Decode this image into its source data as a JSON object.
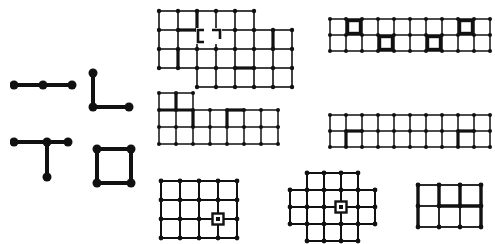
{
  "figure": {
    "background_color": "#ffffff",
    "ink_color": "#111111",
    "canvas": {
      "width": 495,
      "height": 242
    }
  },
  "panels": [
    {
      "id": "panel-path-3",
      "name": "path-graph",
      "type": "node-edge-graph",
      "position": {
        "x": 10,
        "y": 76
      },
      "size": {
        "width": 66,
        "height": 18
      },
      "node_radius": 4.5,
      "edge_width": 4,
      "nodes": [
        [
          4,
          9
        ],
        [
          33,
          9
        ],
        [
          62,
          9
        ]
      ],
      "edges": [
        [
          0,
          1
        ],
        [
          1,
          2
        ]
      ],
      "node_count": 3,
      "edge_count": 2
    },
    {
      "id": "panel-ell",
      "name": "ell-graph",
      "type": "node-edge-graph",
      "position": {
        "x": 88,
        "y": 68
      },
      "size": {
        "width": 46,
        "height": 46
      },
      "node_radius": 4.5,
      "edge_width": 4,
      "nodes": [
        [
          5,
          5
        ],
        [
          5,
          39
        ],
        [
          41,
          39
        ]
      ],
      "edges": [
        [
          0,
          1
        ],
        [
          1,
          2
        ]
      ],
      "node_count": 3,
      "edge_count": 2
    },
    {
      "id": "panel-tee",
      "name": "tee-graph",
      "type": "node-edge-graph",
      "position": {
        "x": 10,
        "y": 136
      },
      "size": {
        "width": 62,
        "height": 46
      },
      "node_radius": 4.5,
      "edge_width": 4,
      "nodes": [
        [
          4,
          6
        ],
        [
          37,
          6
        ],
        [
          58,
          6
        ],
        [
          37,
          41
        ]
      ],
      "edges": [
        [
          0,
          1
        ],
        [
          1,
          2
        ],
        [
          1,
          3
        ]
      ],
      "node_count": 4,
      "edge_count": 3
    },
    {
      "id": "panel-square",
      "name": "square-cycle-graph",
      "type": "node-edge-graph",
      "position": {
        "x": 92,
        "y": 144
      },
      "size": {
        "width": 44,
        "height": 44
      },
      "node_radius": 4.5,
      "edge_width": 4,
      "nodes": [
        [
          5,
          5
        ],
        [
          39,
          5
        ],
        [
          39,
          39
        ],
        [
          5,
          39
        ]
      ],
      "edges": [
        [
          0,
          1
        ],
        [
          1,
          2
        ],
        [
          2,
          3
        ],
        [
          3,
          0
        ]
      ],
      "node_count": 4,
      "edge_count": 4
    },
    {
      "id": "panel-top-middle",
      "name": "stepped-lattice-top",
      "type": "grid-lattice",
      "position": {
        "x": 156,
        "y": 8
      },
      "cell": 19,
      "cols": 7,
      "rows": 4,
      "line_width": 1.6,
      "bold_width": 3.2,
      "dot_radius": 2.2,
      "cells": [
        [
          0,
          0
        ],
        [
          1,
          0
        ],
        [
          2,
          0
        ],
        [
          3,
          0
        ],
        [
          4,
          0
        ],
        [
          0,
          1
        ],
        [
          1,
          1
        ],
        [
          2,
          1
        ],
        [
          3,
          1
        ],
        [
          4,
          1
        ],
        [
          5,
          1
        ],
        [
          6,
          1
        ],
        [
          0,
          2
        ],
        [
          1,
          2
        ],
        [
          2,
          2
        ],
        [
          3,
          2
        ],
        [
          4,
          2
        ],
        [
          5,
          2
        ],
        [
          6,
          2
        ],
        [
          2,
          3
        ],
        [
          3,
          3
        ],
        [
          4,
          3
        ],
        [
          5,
          3
        ],
        [
          6,
          3
        ]
      ],
      "bold_edges": [
        {
          "type": "h",
          "x": 1,
          "y": 1,
          "len": 1
        },
        {
          "type": "v",
          "x": 2,
          "y": 0,
          "len": 1
        },
        {
          "type": "v",
          "x": 1,
          "y": 2,
          "len": 1
        },
        {
          "type": "v",
          "x": 6,
          "y": 1,
          "len": 1
        },
        {
          "type": "h",
          "x": 4,
          "y": 3,
          "len": 1
        }
      ],
      "marker": {
        "shape": "bracket-pair",
        "x": 196,
        "y": 28,
        "width": 22,
        "height": 12
      }
    },
    {
      "id": "panel-top-right",
      "name": "strip-lattice-top-right",
      "type": "grid-lattice",
      "position": {
        "x": 327,
        "y": 16
      },
      "cell": 16,
      "cols": 10,
      "rows": 2,
      "line_width": 1.5,
      "bold_width": 3.2,
      "dot_radius": 2.0,
      "highlight_cells": [
        [
          1,
          0
        ],
        [
          3,
          1
        ],
        [
          6,
          1
        ],
        [
          8,
          0
        ]
      ],
      "highlight_style": "bold-rectangle-outline"
    },
    {
      "id": "panel-mid-left",
      "name": "ell-lattice-middle",
      "type": "grid-lattice",
      "position": {
        "x": 156,
        "y": 90
      },
      "cell": 17,
      "cols": 7,
      "rows": 3,
      "line_width": 1.5,
      "bold_width": 3.2,
      "dot_radius": 2.0,
      "cells": [
        [
          0,
          0
        ],
        [
          1,
          0
        ],
        [
          0,
          1
        ],
        [
          1,
          2
        ],
        [
          0,
          1
        ],
        [
          1,
          1
        ],
        [
          2,
          1
        ],
        [
          3,
          1
        ],
        [
          4,
          1
        ],
        [
          5,
          1
        ],
        [
          6,
          1
        ],
        [
          0,
          2
        ],
        [
          1,
          2
        ],
        [
          2,
          2
        ],
        [
          3,
          2
        ],
        [
          4,
          2
        ],
        [
          5,
          2
        ],
        [
          6,
          2
        ]
      ],
      "bold_edges": [
        {
          "type": "v",
          "x": 1,
          "y": 0,
          "len": 1
        },
        {
          "type": "h",
          "x": 0,
          "y": 1,
          "len": 2
        },
        {
          "type": "v",
          "x": 2,
          "y": 1,
          "len": 1
        },
        {
          "type": "h",
          "x": 4,
          "y": 1,
          "len": 1
        },
        {
          "type": "v",
          "x": 4,
          "y": 1,
          "len": 1
        }
      ]
    },
    {
      "id": "panel-mid-right",
      "name": "strip-lattice-middle-right",
      "type": "grid-lattice",
      "position": {
        "x": 327,
        "y": 112
      },
      "cell": 16,
      "cols": 10,
      "rows": 2,
      "line_width": 1.5,
      "bold_width": 3.2,
      "dot_radius": 2.0,
      "bold_edges": [
        {
          "type": "h",
          "x": 1,
          "y": 1,
          "len": 1
        },
        {
          "type": "v",
          "x": 1,
          "y": 1,
          "len": 1
        },
        {
          "type": "h",
          "x": 8,
          "y": 1,
          "len": 1
        },
        {
          "type": "v",
          "x": 8,
          "y": 1,
          "len": 1
        }
      ]
    },
    {
      "id": "panel-bottom-left",
      "name": "rect-lattice-bottom-left",
      "type": "grid-lattice",
      "position": {
        "x": 158,
        "y": 178
      },
      "cell": 19,
      "cols": 4,
      "rows": 3,
      "line_width": 2.0,
      "dot_radius": 2.4,
      "marker": {
        "shape": "square-in-square",
        "cx": 2,
        "cy": 1,
        "outer": 11,
        "inner": 4
      }
    },
    {
      "id": "panel-bottom-middle",
      "name": "cross-lattice-bottom-middle",
      "type": "grid-lattice",
      "position": {
        "x": 287,
        "y": 170
      },
      "cell": 17,
      "cols": 5,
      "rows": 4,
      "line_width": 2.0,
      "dot_radius": 2.4,
      "cells": [
        [
          1,
          0
        ],
        [
          2,
          0
        ],
        [
          3,
          0
        ],
        [
          0,
          1
        ],
        [
          1,
          1
        ],
        [
          2,
          1
        ],
        [
          3,
          1
        ],
        [
          4,
          1
        ],
        [
          0,
          2
        ],
        [
          1,
          2
        ],
        [
          2,
          2
        ],
        [
          3,
          2
        ],
        [
          4,
          2
        ],
        [
          1,
          3
        ],
        [
          2,
          3
        ],
        [
          3,
          3
        ]
      ],
      "marker": {
        "shape": "square-in-square",
        "cx": 2,
        "cy": 1,
        "outer": 11,
        "inner": 4
      }
    },
    {
      "id": "panel-bottom-right",
      "name": "rect-lattice-bottom-right",
      "type": "grid-lattice",
      "position": {
        "x": 415,
        "y": 182
      },
      "cell": 21,
      "cols": 3,
      "rows": 2,
      "line_width": 1.8,
      "bold_width": 3.4,
      "dot_radius": 2.4,
      "bold_edges": [
        {
          "type": "v",
          "x": 0,
          "y": 0,
          "len": 2
        },
        {
          "type": "v",
          "x": 1,
          "y": 0,
          "len": 1
        },
        {
          "type": "v",
          "x": 2,
          "y": 0,
          "len": 1
        },
        {
          "type": "v",
          "x": 3,
          "y": 0,
          "len": 2
        },
        {
          "type": "h",
          "x": 1,
          "y": 1,
          "len": 2
        }
      ]
    }
  ]
}
